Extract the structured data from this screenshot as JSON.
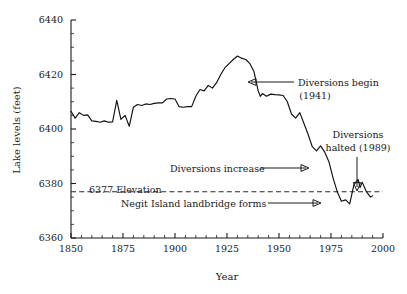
{
  "figure": {
    "background_color": "#ffffff",
    "line_color": "#111111",
    "text_color": "#1a1a1a"
  },
  "chart_data": {
    "type": "line",
    "title": "",
    "subtitle": "",
    "xlabel": "Year",
    "ylabel": "Lake levels (feet)",
    "xlim": [
      1850,
      2000
    ],
    "ylim": [
      6360,
      6440
    ],
    "grid": false,
    "legend": null,
    "x_ticks": [
      1850,
      1875,
      1900,
      1925,
      1950,
      1975,
      2000
    ],
    "x_tick_labels": [
      "1850",
      "1875",
      "1900",
      "1925",
      "1950",
      "1975",
      "2000"
    ],
    "x_minor_tick_step": 5,
    "y_ticks": [
      6360,
      6380,
      6400,
      6420,
      6440
    ],
    "y_tick_labels": [
      "6360",
      "6380",
      "6400",
      "6420",
      "6440"
    ],
    "y_minor_tick_step": 5,
    "reference_lines": [
      {
        "label": "6377 Elevation",
        "value": 6377,
        "style": "dashed",
        "orientation": "horizontal"
      }
    ],
    "annotations": [
      {
        "text": "Diversions begin",
        "text2": "(1941)",
        "x": 1941,
        "y": 6412,
        "arrow": "left"
      },
      {
        "text": "Diversions increase",
        "x": 1965,
        "y": 6392,
        "arrow": "right"
      },
      {
        "text": "Diversions",
        "text2": "halted (1989)",
        "x": 1989,
        "y": 6382,
        "arrow": "down"
      },
      {
        "text": "Negit Island landbridge forms",
        "x": 1977,
        "y": 6375,
        "arrow": "right"
      }
    ],
    "series": [
      {
        "name": "Mono Lake surface elevation",
        "x": [
          1850,
          1852,
          1854,
          1856,
          1858,
          1860,
          1862,
          1864,
          1866,
          1868,
          1870,
          1872,
          1874,
          1876,
          1878,
          1880,
          1882,
          1884,
          1886,
          1888,
          1890,
          1892,
          1894,
          1896,
          1898,
          1900,
          1902,
          1904,
          1906,
          1908,
          1910,
          1912,
          1914,
          1916,
          1918,
          1920,
          1922,
          1924,
          1926,
          1928,
          1930,
          1932,
          1934,
          1936,
          1938,
          1940,
          1941,
          1942,
          1944,
          1946,
          1948,
          1950,
          1952,
          1954,
          1956,
          1958,
          1960,
          1962,
          1964,
          1966,
          1968,
          1970,
          1972,
          1974,
          1976,
          1978,
          1980,
          1982,
          1984,
          1986,
          1988,
          1989,
          1990,
          1992,
          1994,
          1995
        ],
        "y": [
          6406.5,
          6404.0,
          6406.0,
          6405.0,
          6405.2,
          6403.0,
          6402.8,
          6402.5,
          6403.0,
          6402.5,
          6402.6,
          6410.5,
          6403.5,
          6405.0,
          6401.0,
          6408.0,
          6409.0,
          6408.6,
          6409.2,
          6409.0,
          6409.4,
          6409.6,
          6409.6,
          6411.0,
          6411.2,
          6411.0,
          6408.2,
          6408.0,
          6408.2,
          6408.2,
          6412.0,
          6414.5,
          6414.0,
          6416.0,
          6415.0,
          6417.0,
          6420.0,
          6422.5,
          6424.0,
          6425.5,
          6426.8,
          6426.0,
          6425.5,
          6424.0,
          6421.0,
          6414.0,
          6412.0,
          6413.0,
          6412.0,
          6412.8,
          6412.6,
          6412.5,
          6412.3,
          6410.0,
          6405.5,
          6404.0,
          6406.0,
          6402.0,
          6398.0,
          6393.5,
          6392.0,
          6393.8,
          6391.5,
          6388.0,
          6382.0,
          6377.0,
          6373.5,
          6374.0,
          6372.5,
          6379.5,
          6381.5,
          6378.5,
          6380.5,
          6377.0,
          6375.0,
          6375.5
        ]
      }
    ]
  }
}
